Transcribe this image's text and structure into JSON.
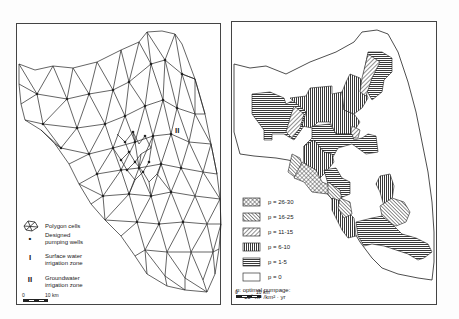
{
  "left_panel": {
    "title": "Finite element mesh",
    "zone_label": "II",
    "legend": [
      {
        "symbol": "polygon-cells-icon",
        "label": "Polygon cells"
      },
      {
        "symbol": "•",
        "label_line1": "Designed",
        "label_line2": "pumping wells"
      },
      {
        "symbol": "I",
        "label_line1": "Surface water",
        "label_line2": "irrigation zone"
      },
      {
        "symbol": "II",
        "label_line1": "Groundwater",
        "label_line2": "irrigation zone"
      }
    ],
    "scale": {
      "start": "0",
      "end": "10 km"
    }
  },
  "right_panel": {
    "legend": [
      {
        "pattern": "crosshatch",
        "label": "p = 26-30"
      },
      {
        "pattern": "diag-back",
        "label": "p = 16-25"
      },
      {
        "pattern": "diag-fwd",
        "label": "p = 11-15"
      },
      {
        "pattern": "vertical",
        "label": "p = 6-10"
      },
      {
        "pattern": "horizontal",
        "label": "p = 1-5"
      },
      {
        "pattern": "blank",
        "label": "p = 0"
      }
    ],
    "note_line1": "p: optimal pumpage:",
    "note_line2": "10⁶ m³ /km² · yr",
    "scale": {
      "start": "0",
      "end": "10 km"
    }
  },
  "colors": {
    "ink": "#222222",
    "frame": "#444444",
    "background": "#ffffff"
  }
}
